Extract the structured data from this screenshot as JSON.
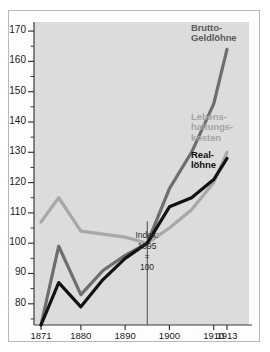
{
  "chart_data": {
    "type": "line",
    "title": "",
    "xlabel": "",
    "ylabel": "",
    "xlim": [
      1871,
      1913
    ],
    "ylim": [
      73,
      173
    ],
    "grid": false,
    "legend_position": "inline-right",
    "annotation": {
      "line1": "Index:",
      "line2": "1895",
      "line3": "=",
      "line4": "100",
      "at_x": 1895,
      "at_y": 100
    },
    "yticks": [
      80,
      90,
      100,
      110,
      120,
      130,
      140,
      150,
      160,
      170
    ],
    "ytick_labels": [
      "80",
      "90",
      "100",
      "110",
      "120",
      "130",
      "140",
      "150",
      "160",
      "170"
    ],
    "yminor": [
      75,
      85,
      95,
      105,
      115,
      125,
      135,
      145,
      155,
      165
    ],
    "xticks": [
      1871,
      1880,
      1890,
      1900,
      1910,
      1913
    ],
    "xtick_labels": [
      "1871",
      "1880",
      "1890",
      "1900",
      "1910",
      "1913"
    ],
    "series": [
      {
        "name": "Brutto-Geldlöhne",
        "label_lines": [
          "Brutto-",
          "Geldlöhne"
        ],
        "color": "#6e6e6e",
        "width": 3.2,
        "x": [
          1871,
          1875,
          1880,
          1885,
          1890,
          1895,
          1900,
          1905,
          1910,
          1913
        ],
        "y": [
          73,
          99,
          83,
          91,
          96,
          100,
          118,
          130,
          146,
          164
        ]
      },
      {
        "name": "Lebenshaltungskosten",
        "label_lines": [
          "Lebens-",
          "haltungs-",
          "kosten"
        ],
        "color": "#a8a8a8",
        "width": 3.2,
        "x": [
          1871,
          1875,
          1880,
          1885,
          1890,
          1895,
          1900,
          1905,
          1910,
          1913
        ],
        "y": [
          107,
          115,
          104,
          103,
          102,
          100,
          105,
          111,
          120,
          130
        ]
      },
      {
        "name": "Reallöhne",
        "label_lines": [
          "Real-",
          "löhne"
        ],
        "color": "#121212",
        "width": 3.2,
        "x": [
          1871,
          1875,
          1880,
          1885,
          1890,
          1895,
          1900,
          1905,
          1910,
          1913
        ],
        "y": [
          73,
          87,
          79,
          88,
          95,
          100,
          112,
          115,
          121,
          128
        ]
      }
    ]
  },
  "colors": {
    "plot_background": "#dcdcdc",
    "frame_border": "#b9b9b9",
    "axis": "#3a3a3a",
    "gross": "#6e6e6e",
    "cost_of_living": "#a8a8a8",
    "real": "#121212"
  }
}
